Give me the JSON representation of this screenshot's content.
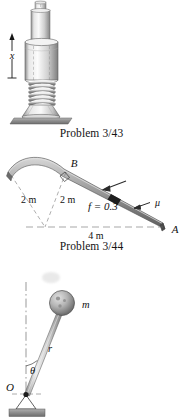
{
  "document": {
    "type": "textbook-problem-figures",
    "background_color": "#ffffff",
    "ink_color": "#111111"
  },
  "figures": [
    {
      "id": "plunger",
      "caption": "Problem 3/43",
      "description": "Spring-loaded plunger in cylindrical housing resting on a ground plate",
      "labels": {
        "displacement": "x"
      },
      "colors": {
        "metal_light": "#f2f2f2",
        "metal_mid": "#c9c9c9",
        "metal_dark": "#8f8f8f",
        "ground": "#9a9a9a"
      }
    },
    {
      "id": "ramp",
      "caption": "Problem 3/44",
      "description": "Curved ramp from B down to A with a sliding block, friction coefficient and dimensions",
      "labels": {
        "point_b": "B",
        "point_a": "A",
        "radius_left": "2 m",
        "radius_right": "2 m",
        "friction": "f = 0.3",
        "span": "4 m",
        "mu": "μ"
      },
      "colors": {
        "ramp_light": "#bdbdbd",
        "ramp_dark": "#6e6e6e",
        "block": "#1e1e1e"
      }
    },
    {
      "id": "pendulum",
      "caption": "",
      "description": "Pendulum pivoted at O with rod of length r at angle theta carrying a spherical mass m",
      "labels": {
        "pivot": "O",
        "rod": "r",
        "angle": "θ",
        "mass": "m"
      },
      "colors": {
        "rod_light": "#e6e6e6",
        "rod_dark": "#8a8a8a",
        "ball_light": "#c9c9c9",
        "ball_dark": "#707070",
        "ground": "#9a9a9a"
      }
    }
  ]
}
